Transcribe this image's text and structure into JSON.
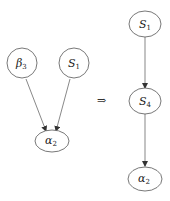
{
  "diagram": {
    "left_graph": {
      "nodes": [
        {
          "id": "beta3",
          "base": "β",
          "sub": "3"
        },
        {
          "id": "S1",
          "base": "S",
          "sub": "1"
        },
        {
          "id": "alpha2",
          "base": "α",
          "sub": "2"
        }
      ],
      "edges": [
        {
          "from": "beta3",
          "to": "alpha2"
        },
        {
          "from": "S1",
          "to": "alpha2"
        }
      ]
    },
    "transform_symbol": "⇒",
    "right_graph": {
      "nodes": [
        {
          "id": "S1",
          "base": "S",
          "sub": "1"
        },
        {
          "id": "S4",
          "base": "S",
          "sub": "4"
        },
        {
          "id": "alpha2",
          "base": "α",
          "sub": "2"
        }
      ],
      "edges": [
        {
          "from": "S1",
          "to": "S4"
        },
        {
          "from": "S4",
          "to": "alpha2"
        }
      ]
    }
  }
}
